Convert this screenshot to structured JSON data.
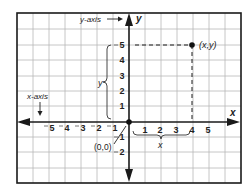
{
  "diagram": {
    "labels": {
      "y_axis_callout": "y-axis",
      "x_axis_callout": "x-axis",
      "y_axis_name": "y",
      "x_axis_name": "x",
      "point": "(x,y)",
      "origin": "(0,0)",
      "x_brace": "x",
      "y_brace": "y"
    },
    "x_ticks_positive": [
      "1",
      "2",
      "3",
      "4",
      "5"
    ],
    "x_ticks_negative": [
      "5",
      "4",
      "3",
      "2",
      "1"
    ],
    "y_ticks_positive": [
      "1",
      "2",
      "3",
      "4",
      "5"
    ],
    "y_ticks_negative": [
      "1",
      "2"
    ],
    "point": {
      "x": 4,
      "y": 5
    },
    "colors": {
      "grid": "#b8b8b8",
      "frame": "#1a1a1a",
      "axis": "#1a1a1a",
      "text": "#222222"
    }
  }
}
